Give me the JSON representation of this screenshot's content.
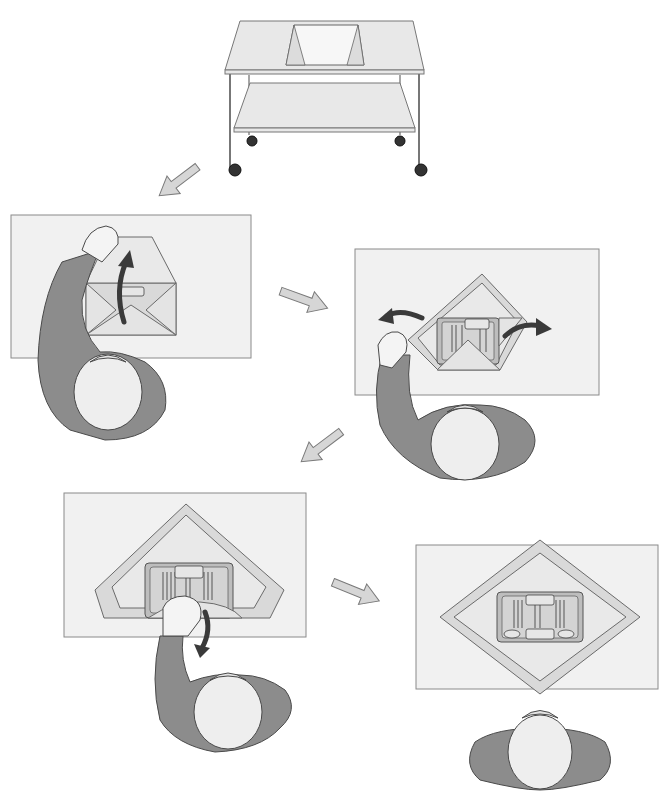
{
  "figure": {
    "title": "",
    "panels": [
      {
        "id": "cart",
        "step": 0,
        "label": "Wrapped pack placed on instrument table (cart with lower shelf and casters)"
      },
      {
        "id": "step1",
        "step": 1,
        "label": "Open top (distal) flap away from body",
        "action_arrow": "up"
      },
      {
        "id": "step2",
        "step": 2,
        "label": "Open side flaps outward",
        "action_arrow": "left-and-right"
      },
      {
        "id": "step3",
        "step": 3,
        "label": "Pull final flap toward body",
        "action_arrow": "down"
      },
      {
        "id": "step4",
        "step": 4,
        "label": "Pack fully opened, instrument tray exposed"
      }
    ],
    "flow_arrows": [
      {
        "from": "cart",
        "to": "step1",
        "direction": "down-left"
      },
      {
        "from": "step1",
        "to": "step2",
        "direction": "right"
      },
      {
        "from": "step2",
        "to": "step3",
        "direction": "down-left"
      },
      {
        "from": "step3",
        "to": "step4",
        "direction": "right"
      }
    ],
    "colors": {
      "table_surface": "#f1f1f1",
      "gown": "#8c8c8c",
      "wrap": "#d9d9d9",
      "action_arrow": "#3a3a3a",
      "flow_arrow": "#d6d6d6"
    }
  }
}
